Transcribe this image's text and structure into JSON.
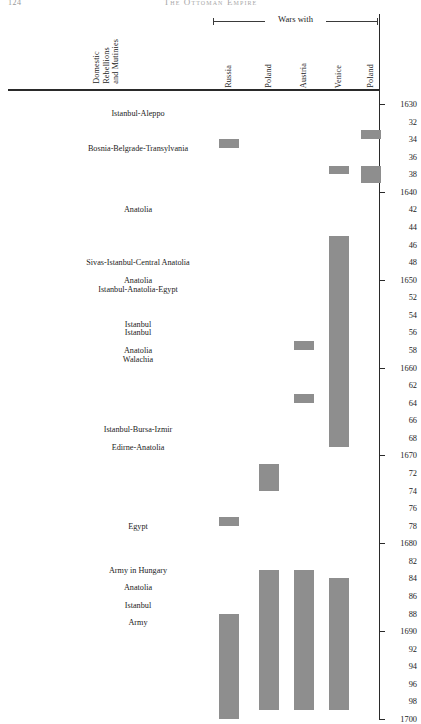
{
  "running_head": {
    "folio": "124",
    "title": "The Ottoman Empire"
  },
  "header": {
    "domestic_column": "Domestic\nRebellions\nand Mutinies",
    "wars_group_label": "Wars with",
    "war_columns": [
      "Russia",
      "Poland",
      "Austria",
      "Venice",
      "Poland"
    ]
  },
  "chart_data": {
    "type": "bar",
    "orientation": "vertical-timeline",
    "xlabel": "",
    "ylabel": "Year",
    "ylim": [
      1630,
      1700
    ],
    "yaxis_inverted": true,
    "grid": false,
    "legend_position": "none",
    "tick_interval": 2,
    "tick_labels": [
      "1630",
      "32",
      "34",
      "36",
      "38",
      "1640",
      "42",
      "44",
      "46",
      "48",
      "1650",
      "52",
      "54",
      "56",
      "58",
      "1660",
      "62",
      "64",
      "66",
      "68",
      "1670",
      "72",
      "74",
      "76",
      "78",
      "1680",
      "82",
      "84",
      "86",
      "88",
      "1690",
      "92",
      "94",
      "96",
      "98",
      "1700"
    ],
    "tick_years": [
      1630,
      1632,
      1634,
      1636,
      1638,
      1640,
      1642,
      1644,
      1646,
      1648,
      1650,
      1652,
      1654,
      1656,
      1658,
      1660,
      1662,
      1664,
      1666,
      1668,
      1670,
      1672,
      1674,
      1676,
      1678,
      1680,
      1682,
      1684,
      1686,
      1688,
      1690,
      1692,
      1694,
      1696,
      1698,
      1700
    ],
    "categories": [
      "Domestic Rebellions and Mutinies",
      "Russia",
      "Poland",
      "Austria",
      "Venice",
      "Poland"
    ],
    "series": [
      {
        "name": "Domestic Rebellions and Mutinies",
        "type": "event-labels",
        "events": [
          {
            "label": "Istanbul-Aleppo",
            "year": 1631
          },
          {
            "label": "Bosnia-Belgrade-Transylvania",
            "year": 1635
          },
          {
            "label": "Anatolia",
            "year": 1642
          },
          {
            "label": "Sivas-Istanbul-Central Anatolia",
            "year": 1648
          },
          {
            "label": "Anatolia",
            "year": 1650
          },
          {
            "label": "Istanbul-Anatolia-Egypt",
            "year": 1651
          },
          {
            "label": "Istanbul",
            "year": 1655
          },
          {
            "label": "Istanbul",
            "year": 1656
          },
          {
            "label": "Anatolia",
            "year": 1658
          },
          {
            "label": "Walachia",
            "year": 1659
          },
          {
            "label": "Istanbul-Bursa-Izmir",
            "year": 1667
          },
          {
            "label": "Edirne-Anatolia",
            "year": 1669
          },
          {
            "label": "Egypt",
            "year": 1678
          },
          {
            "label": "Army in Hungary",
            "year": 1683
          },
          {
            "label": "Anatolia",
            "year": 1685
          },
          {
            "label": "Istanbul",
            "year": 1687
          },
          {
            "label": "Army",
            "year": 1689
          }
        ]
      },
      {
        "name": "Russia",
        "type": "war-bars",
        "bars": [
          {
            "start": 1634,
            "end": 1635
          },
          {
            "start": 1677,
            "end": 1678
          },
          {
            "start": 1688,
            "end": 1700
          }
        ]
      },
      {
        "name": "Poland",
        "type": "war-bars",
        "bars": [
          {
            "start": 1671,
            "end": 1674
          },
          {
            "start": 1683,
            "end": 1699
          }
        ]
      },
      {
        "name": "Austria",
        "type": "war-bars",
        "bars": [
          {
            "start": 1657,
            "end": 1658
          },
          {
            "start": 1663,
            "end": 1664
          },
          {
            "start": 1683,
            "end": 1699
          }
        ]
      },
      {
        "name": "Venice",
        "type": "war-bars",
        "bars": [
          {
            "start": 1637,
            "end": 1638
          },
          {
            "start": 1645,
            "end": 1669
          },
          {
            "start": 1684,
            "end": 1699
          }
        ]
      },
      {
        "name": "Poland",
        "type": "war-bars",
        "bars": [
          {
            "start": 1633,
            "end": 1634
          },
          {
            "start": 1637,
            "end": 1639
          }
        ]
      }
    ]
  }
}
